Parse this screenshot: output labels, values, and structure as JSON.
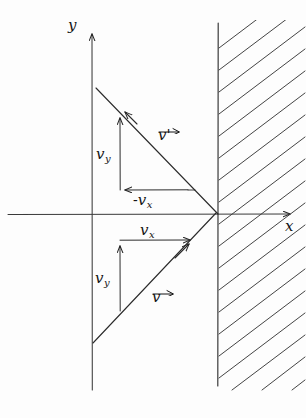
{
  "figure": {
    "stroke_color": "#262626",
    "background_color": "#fdfdfd",
    "width": 306,
    "height": 418
  },
  "axes": {
    "y_label": "y",
    "x_label": "x",
    "origin": {
      "x": 92,
      "y": 214
    },
    "y_axis": {
      "x": 92,
      "top_y": 28,
      "bottom_y": 390
    },
    "x_axis": {
      "y": 214,
      "left_x": 8,
      "right_x": 296
    }
  },
  "wall": {
    "label": "hatched-wall",
    "line_x": 218,
    "top_y": 23,
    "bottom_y": 386,
    "hatch_count": 17,
    "hatch_angle_label": "45"
  },
  "vectors": {
    "incoming": {
      "name": "v",
      "label": "v",
      "from": {
        "x": 93,
        "y": 343
      },
      "to": {
        "x": 218,
        "y": 214
      }
    },
    "outgoing": {
      "name": "v-prime",
      "label": "v",
      "prime": "'",
      "from": {
        "x": 218,
        "y": 214
      },
      "to": {
        "x": 93,
        "y": 86
      }
    }
  },
  "components": {
    "upper_vy": {
      "label": "v",
      "sub": "y"
    },
    "upper_vx": {
      "minus": "-",
      "label": "v",
      "sub": "x"
    },
    "lower_vx": {
      "label": "v",
      "sub": "x"
    },
    "lower_vy": {
      "label": "v",
      "sub": "y"
    }
  }
}
